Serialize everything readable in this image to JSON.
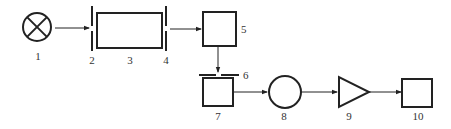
{
  "diagram": {
    "type": "optical-instrument-block-diagram",
    "components": [
      {
        "id": "1",
        "label": "1",
        "shape": "lamp-circle-with-x"
      },
      {
        "id": "2",
        "label": "2",
        "shape": "vertical-slit"
      },
      {
        "id": "3",
        "label": "3",
        "shape": "rectangle"
      },
      {
        "id": "4",
        "label": "4",
        "shape": "vertical-slit"
      },
      {
        "id": "5",
        "label": "5",
        "shape": "square"
      },
      {
        "id": "6",
        "label": "6",
        "shape": "horizontal-slit"
      },
      {
        "id": "7",
        "label": "7",
        "shape": "square"
      },
      {
        "id": "8",
        "label": "8",
        "shape": "circle"
      },
      {
        "id": "9",
        "label": "9",
        "shape": "triangle-amplifier"
      },
      {
        "id": "10",
        "label": "10",
        "shape": "square"
      }
    ],
    "connections": [
      {
        "from": "1",
        "to": "2"
      },
      {
        "from": "4",
        "to": "5"
      },
      {
        "from": "5",
        "to": "6"
      },
      {
        "from": "7",
        "to": "8"
      },
      {
        "from": "8",
        "to": "9"
      },
      {
        "from": "9",
        "to": "10"
      }
    ]
  }
}
